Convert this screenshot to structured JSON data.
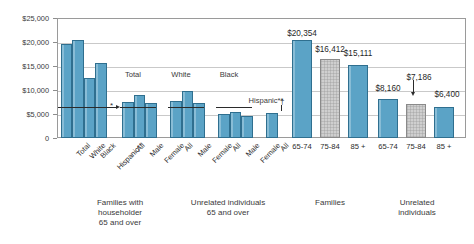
{
  "chart_data": {
    "type": "bar",
    "title": "",
    "xlabel": "",
    "ylabel": "",
    "ylim": [
      0,
      25000
    ],
    "grid": true,
    "legend_position": "none",
    "ytick_labels": [
      "$25,000",
      "$20,000",
      "$15,000",
      "$10,000",
      "$5,000",
      "0"
    ],
    "ytick_values": [
      25000,
      20000,
      15000,
      10000,
      5000,
      0
    ],
    "reference_line_value": 6500,
    "series": [
      {
        "name": "Median income",
        "categories": [
          "Total",
          "White",
          "Black",
          "Hispanic**",
          "All",
          "Male",
          "Female",
          "All",
          "Male",
          "Female",
          "All",
          "Male",
          "Female",
          "All",
          "65-74",
          "75-84",
          "85 +",
          "65-74",
          "75-84",
          "85 +"
        ],
        "values": [
          19600,
          20354,
          12500,
          15700,
          7400,
          8900,
          7350,
          7750,
          9750,
          7300,
          4900,
          5400,
          4600,
          5200,
          20354,
          16412,
          15111,
          8160,
          7186,
          6400
        ]
      }
    ],
    "annotations": [
      {
        "label": "$20,354",
        "value": 20354
      },
      {
        "label": "$16,412",
        "value": 16412
      },
      {
        "label": "$15,111",
        "value": 15111
      },
      {
        "label": "$8,160",
        "value": 8160
      },
      {
        "label": "$7,186",
        "value": 7186
      },
      {
        "label": "$6,400",
        "value": 6400
      }
    ]
  },
  "yaxis": {
    "ticks": [
      {
        "label": "$25,000"
      },
      {
        "label": "$20,000"
      },
      {
        "label": "$15,000"
      },
      {
        "label": "$10,000"
      },
      {
        "label": "$5,000"
      },
      {
        "label": "0"
      }
    ]
  },
  "bars": [
    {
      "name": "families-total",
      "style": "blue",
      "value": 19600,
      "x": 60.5,
      "w": 11.5,
      "label": "Total",
      "rot": true
    },
    {
      "name": "families-white",
      "style": "blue",
      "value": 20354,
      "x": 72.0,
      "w": 11.5,
      "label": "White",
      "rot": true
    },
    {
      "name": "families-black",
      "style": "blue",
      "value": 12500,
      "x": 83.5,
      "w": 11.5,
      "label": "Black",
      "rot": true
    },
    {
      "name": "families-hispanic",
      "style": "blue",
      "value": 15700,
      "x": 95.0,
      "w": 11.5,
      "label": "Hispanic**",
      "rot": true
    },
    {
      "name": "unrel-total-all",
      "style": "blue",
      "value": 7400,
      "x": 122.0,
      "w": 11.5,
      "label": "All",
      "rot": true
    },
    {
      "name": "unrel-total-male",
      "style": "blue",
      "value": 8900,
      "x": 133.5,
      "w": 11.5,
      "label": "Male",
      "rot": true
    },
    {
      "name": "unrel-total-female",
      "style": "blue",
      "value": 7350,
      "x": 145.0,
      "w": 11.5,
      "label": "Female",
      "rot": true
    },
    {
      "name": "unrel-white-all",
      "style": "blue",
      "value": 7750,
      "x": 170.0,
      "w": 11.5,
      "label": "All",
      "rot": true
    },
    {
      "name": "unrel-white-male",
      "style": "blue",
      "value": 9750,
      "x": 181.5,
      "w": 11.5,
      "label": "Male",
      "rot": true
    },
    {
      "name": "unrel-white-female",
      "style": "blue",
      "value": 7300,
      "x": 193.0,
      "w": 11.5,
      "label": "Female",
      "rot": true
    },
    {
      "name": "unrel-black-all",
      "style": "blue",
      "value": 4900,
      "x": 218.0,
      "w": 11.5,
      "label": "All",
      "rot": true
    },
    {
      "name": "unrel-black-male",
      "style": "blue",
      "value": 5400,
      "x": 229.5,
      "w": 11.5,
      "label": "Male",
      "rot": true
    },
    {
      "name": "unrel-black-female",
      "style": "blue",
      "value": 4600,
      "x": 241.0,
      "w": 11.5,
      "label": "Female",
      "rot": true
    },
    {
      "name": "unrel-hispanic-all",
      "style": "blue",
      "value": 5200,
      "x": 266.0,
      "w": 11.5,
      "label": "All",
      "rot": true
    },
    {
      "name": "families-65-74",
      "style": "blue",
      "value": 20354,
      "x": 292.0,
      "w": 20.0,
      "label": "65-74",
      "rot": false
    },
    {
      "name": "families-75-84",
      "style": "gray",
      "value": 16412,
      "x": 320.0,
      "w": 20.0,
      "label": "75-84",
      "rot": false
    },
    {
      "name": "families-85-plus",
      "style": "blue",
      "value": 15111,
      "x": 348.0,
      "w": 20.0,
      "label": "85 +",
      "rot": false
    },
    {
      "name": "unrel-65-74",
      "style": "blue",
      "value": 8160,
      "x": 378.0,
      "w": 20.0,
      "label": "65-74",
      "rot": false
    },
    {
      "name": "unrel-75-84",
      "style": "gray",
      "value": 7186,
      "x": 406.0,
      "w": 20.0,
      "label": "75-84",
      "rot": false
    },
    {
      "name": "unrel-85-plus",
      "style": "blue",
      "value": 6400,
      "x": 434.0,
      "w": 20.0,
      "label": "85 +",
      "rot": false
    }
  ],
  "value_labels": [
    {
      "name": "value-label-20354",
      "text": "$20,354",
      "x": 302,
      "y": 29
    },
    {
      "name": "value-label-16412",
      "text": "$16,412",
      "x": 330,
      "y": 45
    },
    {
      "name": "value-label-15111",
      "text": "$15,111",
      "x": 358,
      "y": 49
    },
    {
      "name": "value-label-8160",
      "text": "$8,160",
      "x": 388,
      "y": 84
    },
    {
      "name": "value-label-7186",
      "text": "$7,186",
      "x": 419,
      "y": 73
    },
    {
      "name": "value-label-6400",
      "text": "$6,400",
      "x": 447,
      "y": 90
    }
  ],
  "inner_captions": [
    {
      "name": "inner-caption-total",
      "text": "Total",
      "x": 133,
      "y": 70
    },
    {
      "name": "inner-caption-white",
      "text": "White",
      "x": 181,
      "y": 70
    },
    {
      "name": "inner-caption-black",
      "text": "Black",
      "x": 229,
      "y": 70
    },
    {
      "name": "inner-caption-hispanic",
      "text": "Hispanic**",
      "x": 266,
      "y": 96
    }
  ],
  "super_captions": [
    {
      "name": "group-caption-families-householder",
      "text": "Families with\nhouseholder\n65 and over",
      "x": 120,
      "y": 198
    },
    {
      "name": "group-caption-unrelated-65-over",
      "text": "Unrelated individuals\n65 and over",
      "x": 228,
      "y": 198
    },
    {
      "name": "group-caption-families",
      "text": "Families",
      "x": 330,
      "y": 198
    },
    {
      "name": "group-caption-unrelated-individuals",
      "text": "Unrelated\nindividuals",
      "x": 417,
      "y": 198
    }
  ],
  "markers": {
    "asterisk": "*",
    "dagger": "†"
  }
}
